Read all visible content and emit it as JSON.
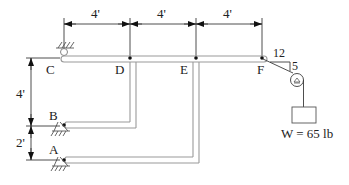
{
  "diagram": {
    "type": "mechanism / frame statics problem",
    "dimensions": {
      "horizontal": [
        "4'",
        "4'",
        "4'"
      ],
      "vertical": [
        "4'",
        "2'"
      ],
      "slope": {
        "run": "12",
        "rise": "5"
      }
    },
    "points": {
      "C": "C",
      "D": "D",
      "E": "E",
      "F": "F",
      "B": "B",
      "A": "A"
    },
    "load": {
      "label": "W = 65 lb"
    },
    "colors": {
      "line": "#3a3a3a",
      "member": "#9a9a9a",
      "text": "#222222"
    }
  }
}
